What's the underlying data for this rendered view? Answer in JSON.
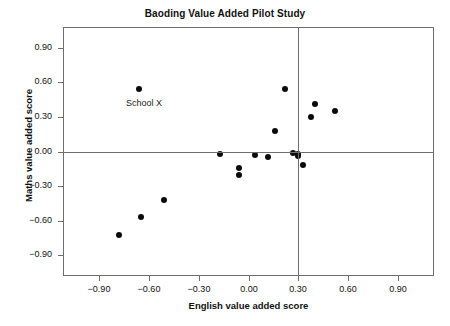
{
  "chart_data": {
    "type": "scatter",
    "title": "Baoding Value Added Pilot Study",
    "xlabel": "English value added score",
    "ylabel": "Maths value added score",
    "xlim": [
      -1.12,
      1.12
    ],
    "ylim": [
      -1.08,
      1.08
    ],
    "grid": false,
    "legend": "none",
    "xticks": [
      -0.9,
      -0.6,
      -0.3,
      0.0,
      0.3,
      0.6,
      0.9
    ],
    "xticklabels": [
      "−0.90",
      "−0.60",
      "−0.30",
      "0.00",
      "0.30",
      "0.60",
      "0.90"
    ],
    "yticks": [
      -0.9,
      -0.6,
      -0.3,
      0.0,
      0.3,
      0.6,
      0.9
    ],
    "yticklabels": [
      "−0.90",
      "−0.60",
      "−0.30",
      "0.00",
      "0.30",
      "0.60",
      "0.90"
    ],
    "reference_lines": [
      {
        "orientation": "horizontal",
        "value": 0.0
      },
      {
        "orientation": "vertical",
        "value": 0.3
      }
    ],
    "points": [
      {
        "x": -0.78,
        "y": -0.72
      },
      {
        "x": -0.66,
        "y": 0.54,
        "label": "School X"
      },
      {
        "x": -0.65,
        "y": -0.57
      },
      {
        "x": -0.51,
        "y": -0.42
      },
      {
        "x": -0.17,
        "y": -0.02
      },
      {
        "x": -0.06,
        "y": -0.14
      },
      {
        "x": -0.06,
        "y": -0.2
      },
      {
        "x": 0.04,
        "y": -0.03
      },
      {
        "x": 0.12,
        "y": -0.05
      },
      {
        "x": 0.16,
        "y": 0.18
      },
      {
        "x": 0.22,
        "y": 0.54
      },
      {
        "x": 0.27,
        "y": -0.01
      },
      {
        "x": 0.3,
        "y": -0.02
      },
      {
        "x": 0.3,
        "y": -0.04
      },
      {
        "x": 0.33,
        "y": -0.12
      },
      {
        "x": 0.38,
        "y": 0.3
      },
      {
        "x": 0.4,
        "y": 0.41
      },
      {
        "x": 0.52,
        "y": 0.35
      }
    ],
    "annotations": [
      {
        "text": "School X",
        "x": -0.74,
        "y": 0.41
      }
    ],
    "colors": {
      "marker": "#0b0b0b",
      "axis": "#6e6e6e",
      "text": "#111111",
      "background": "#ffffff"
    }
  },
  "footer": {
    "partial_text": ""
  }
}
